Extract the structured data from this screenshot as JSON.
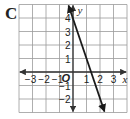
{
  "panel_label": "C",
  "chart_data": {
    "type": "line",
    "title": "",
    "xlabel": "x",
    "ylabel": "y",
    "origin_label": "O",
    "xlim": [
      -4,
      4
    ],
    "ylim": [
      -3,
      5
    ],
    "grid": true,
    "x_ticks": [
      "−3",
      "−2",
      "−1",
      "1",
      "2",
      "3"
    ],
    "x_tick_values": [
      -3,
      -2,
      -1,
      1,
      2,
      3
    ],
    "y_ticks": [
      "4",
      "3",
      "2",
      "1",
      "−1",
      "−2"
    ],
    "y_tick_values": [
      4,
      3,
      2,
      1,
      -1,
      -2
    ],
    "series": [
      {
        "name": "line",
        "equation": "y = -3x + 4",
        "x": [
          -0.33,
          2.33
        ],
        "y": [
          5,
          -3
        ],
        "arrows": "both",
        "color": "#1a1a1a"
      }
    ]
  },
  "colors": {
    "grid": "#9a9a9a",
    "axis": "#333333",
    "line": "#1a1a1a"
  }
}
